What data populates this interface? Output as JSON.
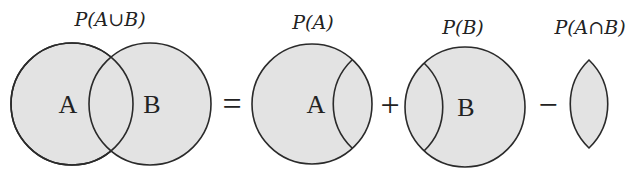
{
  "diagram": {
    "colors": {
      "fill": "#e3e3e3",
      "stroke": "#2a2a2a",
      "background": "#ffffff"
    },
    "terms": [
      {
        "id": "union",
        "label": "P(A∪B)",
        "sets": [
          "A",
          "B"
        ]
      },
      {
        "id": "pa",
        "label": "P(A)",
        "sets": [
          "A"
        ]
      },
      {
        "id": "pb",
        "label": "P(B)",
        "sets": [
          "B"
        ]
      },
      {
        "id": "intersection",
        "label": "P(A∩B)",
        "sets": []
      }
    ],
    "operators": [
      "=",
      "+",
      "−"
    ],
    "set_letters": {
      "a": "A",
      "b": "B"
    }
  }
}
